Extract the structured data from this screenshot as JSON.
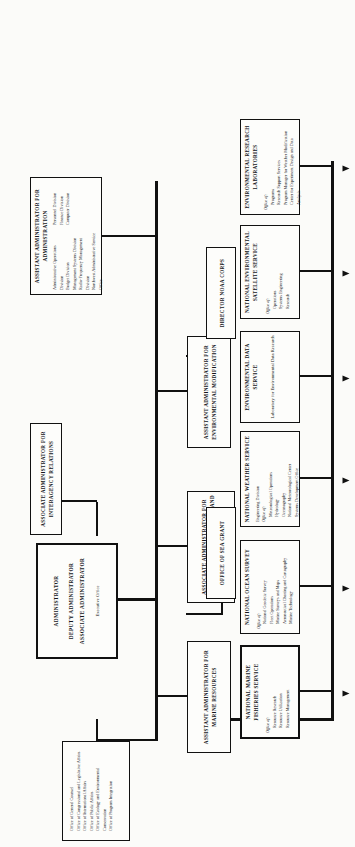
{
  "chart": {
    "type": "org-chart",
    "head": {
      "name": "administrator-box",
      "lines": [
        "ADMINISTRATOR",
        "DEPUTY ADMINISTRATOR",
        "ASSOCIATE ADMINISTRATOR"
      ],
      "sub": "Executive Office"
    },
    "staff_offices": {
      "name": "staff-offices-box",
      "items": [
        "Office of General Counsel",
        "Office of Congressional and Legislative Affairs",
        "Office of International Affairs",
        "Office of Public Affairs",
        "Office of Ecology and Environmental Conservation",
        "Office of Program Integration"
      ]
    },
    "associate_ia": {
      "name": "associate-administrator-interagency-relations",
      "title": "ASSOCIATE ADMINISTRATOR FOR INTERAGENCY RELATIONS"
    },
    "assistant_admin": {
      "name": "assistant-administrator-administration",
      "title": "ASSISTANT ADMINISTRATOR FOR ADMINISTRATION",
      "col1": [
        "Administrative Operations Division",
        "Budget Division",
        "Management Systems Division",
        "Radio-Frequency Management Division",
        "Northwest Administrative Service Office"
      ],
      "col2": [
        "Personnel Division",
        "Finance Division",
        "Computer Division"
      ]
    },
    "assistant_env_mod": {
      "name": "assistant-administrator-environmental-modification",
      "title": "ASSISTANT ADMINISTRATOR FOR ENVIRONMENTAL MODIFICATION"
    },
    "associate_emp": {
      "name": "associate-administrator-environmental-monitoring-prediction",
      "title": "ASSOCIATE ADMINISTRATOR FOR ENVIRONMENTAL MONITORING AND PREDICTION"
    },
    "assistant_marine": {
      "name": "assistant-administrator-marine-resources",
      "title": "ASSISTANT ADMINISTRATOR FOR MARINE RESOURCES"
    },
    "noaa_corps": {
      "name": "director-noaa-corps",
      "title": "DIRECTOR NOAA CORPS"
    },
    "sea_grant": {
      "name": "office-of-sea-grant",
      "title": "OFFICE OF SEA GRANT"
    },
    "line_units": [
      {
        "name": "national-marine-fisheries-service",
        "title": "NATIONAL MARINE FISHERIES SERVICE",
        "head": "Office of:",
        "items": [
          "Resource Research",
          "Resource Utilization",
          "Resource Management"
        ]
      },
      {
        "name": "national-ocean-survey",
        "title": "NATIONAL OCEAN SURVEY",
        "head": "Office of:",
        "items": [
          "National Geodetic Survey",
          "Fleet Operations",
          "Marine Surveys and Maps",
          "Aeronautical Charting and Cartography",
          "Marine Technology"
        ]
      },
      {
        "name": "national-weather-service",
        "title": "NATIONAL WEATHER SERVICE",
        "pre": "Engineering Division",
        "head": "Office of:",
        "items": [
          "Meteorological Operations",
          "Hydrology",
          "Oceanography",
          "National Meteorological Center",
          "Systems Development Office"
        ]
      },
      {
        "name": "environmental-data-service",
        "title": "ENVIRONMENTAL DATA SERVICE",
        "head": "",
        "items": [
          "Laboratory for Environmental Data Research"
        ]
      },
      {
        "name": "national-environmental-satellite-service",
        "title": "NATIONAL ENVIRONMENTAL SATELLITE SERVICE",
        "head": "Office of:",
        "items": [
          "Operations",
          "Systems Engineering",
          "Research"
        ]
      },
      {
        "name": "environmental-research-laboratories",
        "title": "ENVIRONMENTAL RESEARCH LABORATORIES",
        "head": "Office of:",
        "items": [
          "Programs",
          "Research Support Services",
          "Program Manager for Weather Modification",
          "Center for Experiment Design and Data Analysis"
        ]
      }
    ]
  }
}
